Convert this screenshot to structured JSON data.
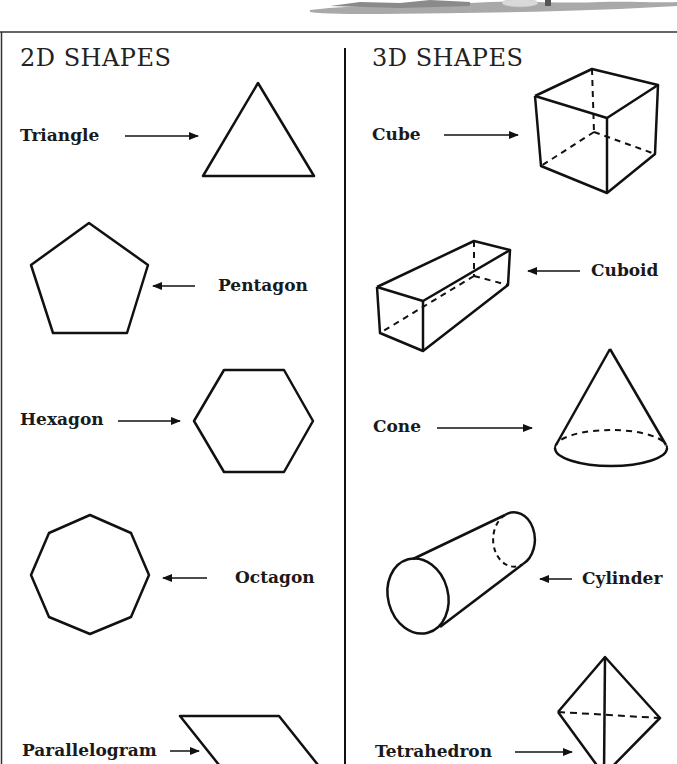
{
  "columns": {
    "left": {
      "heading": "2D SHAPES",
      "shapes": [
        {
          "name": "Triangle",
          "label": "Triangle"
        },
        {
          "name": "Pentagon",
          "label": "Pentagon"
        },
        {
          "name": "Hexagon",
          "label": "Hexagon"
        },
        {
          "name": "Octagon",
          "label": "Octagon"
        },
        {
          "name": "Parallelogram",
          "label": "Parallelogram"
        }
      ]
    },
    "right": {
      "heading": "3D SHAPES",
      "shapes": [
        {
          "name": "Cube",
          "label": "Cube"
        },
        {
          "name": "Cuboid",
          "label": "Cuboid"
        },
        {
          "name": "Cone",
          "label": "Cone"
        },
        {
          "name": "Cylinder",
          "label": "Cylinder"
        },
        {
          "name": "Tetrahedron",
          "label": "Tetrahedron"
        }
      ]
    }
  },
  "colors": {
    "line": "#111111",
    "border": "#333333",
    "ground": "#a9a9a9"
  }
}
